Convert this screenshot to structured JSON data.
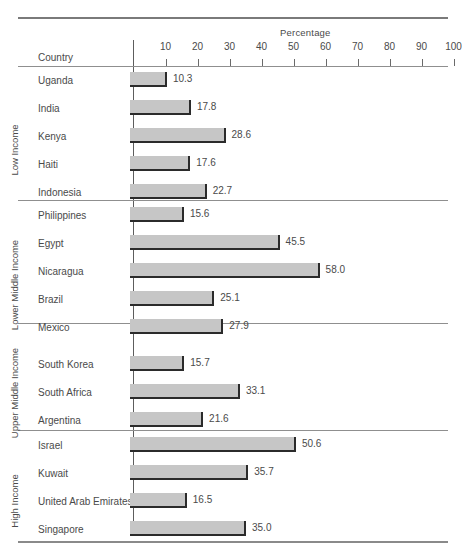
{
  "chart_data": {
    "type": "bar",
    "title": "",
    "xlabel": "Percentage",
    "ylabel": "Country",
    "orientation": "horizontal",
    "xlim": [
      0,
      100
    ],
    "xticks": [
      10,
      20,
      30,
      40,
      50,
      60,
      70,
      80,
      90,
      100
    ],
    "grid": false,
    "legend": "none",
    "categories": [
      "Uganda",
      "India",
      "Kenya",
      "Haiti",
      "Indonesia",
      "Philippines",
      "Egypt",
      "Nicaragua",
      "Brazil",
      "Mexico",
      "South Korea",
      "South Africa",
      "Argentina",
      "Israel",
      "Kuwait",
      "United Arab Emirates",
      "Singapore"
    ],
    "values": [
      10.3,
      17.8,
      28.6,
      17.6,
      22.7,
      15.6,
      45.5,
      58.0,
      25.1,
      27.9,
      15.7,
      33.1,
      21.6,
      50.6,
      35.7,
      16.5,
      35.0
    ],
    "groups": [
      {
        "label": "Low Income",
        "rows": [
          {
            "name": "Uganda",
            "value": 10.3,
            "value_label": "10.3"
          },
          {
            "name": "India",
            "value": 17.8,
            "value_label": "17.8"
          },
          {
            "name": "Kenya",
            "value": 28.6,
            "value_label": "28.6"
          },
          {
            "name": "Haiti",
            "value": 17.6,
            "value_label": "17.6"
          },
          {
            "name": "Indonesia",
            "value": 22.7,
            "value_label": "22.7"
          }
        ]
      },
      {
        "label": "Lower Middle Income",
        "rows": [
          {
            "name": "Philippines",
            "value": 15.6,
            "value_label": "15.6"
          },
          {
            "name": "Egypt",
            "value": 45.5,
            "value_label": "45.5"
          },
          {
            "name": "Nicaragua",
            "value": 58.0,
            "value_label": "58.0"
          },
          {
            "name": "Brazil",
            "value": 25.1,
            "value_label": "25.1"
          },
          {
            "name": "Mexico",
            "value": 27.9,
            "value_label": "27.9"
          }
        ]
      },
      {
        "label": "Upper Middle Income",
        "rows": [
          {
            "name": "South Korea",
            "value": 15.7,
            "value_label": "15.7"
          },
          {
            "name": "South Africa",
            "value": 33.1,
            "value_label": "33.1"
          },
          {
            "name": "Argentina",
            "value": 21.6,
            "value_label": "21.6"
          }
        ]
      },
      {
        "label": "High Income",
        "rows": [
          {
            "name": "Israel",
            "value": 50.6,
            "value_label": "50.6"
          },
          {
            "name": "Kuwait",
            "value": 35.7,
            "value_label": "35.7"
          },
          {
            "name": "United Arab Emirates",
            "value": 16.5,
            "value_label": "16.5"
          },
          {
            "name": "Singapore",
            "value": 35.0,
            "value_label": "35.0"
          }
        ]
      }
    ],
    "colors": {
      "bar_fill": "#c6c6c6",
      "bar_edge": "#2b2b2b",
      "text": "#4a4a4a",
      "rule": "#6e6e6e",
      "axis": "#5d5d5d"
    }
  },
  "caption": ""
}
